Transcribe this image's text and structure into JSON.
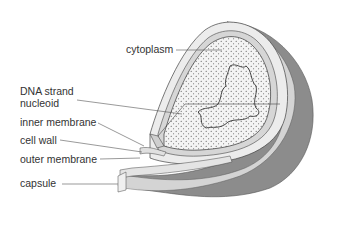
{
  "diagram": {
    "labels": [
      {
        "id": "cytoplasm",
        "text": "cytoplasm"
      },
      {
        "id": "dna",
        "line1": "DNA strand",
        "line2": "nucleoid"
      },
      {
        "id": "inner_membrane",
        "text": "inner membrane"
      },
      {
        "id": "cell_wall",
        "text": "cell wall"
      },
      {
        "id": "outer_membrane",
        "text": "outer membrane"
      },
      {
        "id": "capsule",
        "text": "capsule"
      }
    ],
    "colors": {
      "capsule_shadow": "#8c8c8c",
      "capsule_face": "#e6e6e6",
      "cytoplasm_fill": "#f2f2f2",
      "outline": "#3a3a3a",
      "leader_line": "#555555"
    }
  }
}
